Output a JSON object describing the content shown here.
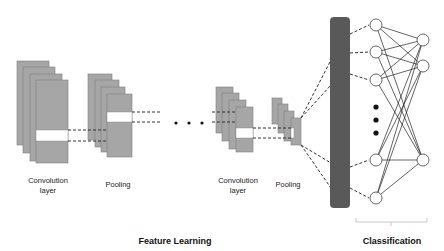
{
  "labels": {
    "conv1": "Convolution layer",
    "pool1": "Pooling",
    "conv2": "Convolution layer",
    "pool2": "Pooling",
    "feature_learning": "Feature Learning",
    "classification": "Classification"
  },
  "colors": {
    "feature_map_fill": "#a6a6a6",
    "feature_map_stroke": "#7f7f7f",
    "highlight_band": "#ffffff",
    "dense_bar": "#595959",
    "node_stroke": "#404040",
    "edge": "#222222",
    "dashed": "#333333"
  },
  "stacks": [
    {
      "name": "conv1-stack",
      "rects": [
        [
          17,
          61,
          32,
          84
        ],
        [
          23,
          67,
          32,
          86
        ],
        [
          30,
          74,
          32,
          87
        ],
        [
          36,
          80,
          32,
          83
        ]
      ],
      "band": [
        36,
        130,
        32,
        11
      ]
    },
    {
      "name": "pool1-stack",
      "rects": [
        [
          88,
          74,
          24,
          66
        ],
        [
          95,
          80,
          24,
          67
        ],
        [
          101,
          87,
          24,
          65
        ],
        [
          107,
          94,
          25,
          63
        ]
      ],
      "band": [
        107,
        112,
        25,
        10
      ]
    },
    {
      "name": "conv2-stack",
      "rects": [
        [
          216,
          87,
          17,
          46
        ],
        [
          222,
          93,
          17,
          48
        ],
        [
          229,
          100,
          17,
          49
        ],
        [
          236,
          107,
          17,
          45
        ]
      ],
      "band": [
        236,
        128,
        17,
        10
      ]
    },
    {
      "name": "pool2-stack",
      "rects": [
        [
          272,
          98,
          10,
          26
        ],
        [
          278,
          104,
          10,
          29
        ],
        [
          284,
          111,
          10,
          30
        ],
        [
          291,
          118,
          10,
          27
        ]
      ],
      "band": [
        291,
        128,
        3,
        10
      ]
    }
  ],
  "dense_bar": {
    "x": 330,
    "y": 17,
    "w": 20,
    "h": 191
  },
  "hidden_nodes": [
    [
      376,
      25
    ],
    [
      376,
      52
    ],
    [
      376,
      80
    ],
    [
      376,
      160
    ],
    [
      376,
      198
    ]
  ],
  "output_nodes": [
    [
      423,
      40
    ],
    [
      423,
      66
    ],
    [
      423,
      160
    ]
  ],
  "ellipsis_dots_h": [
    [
      176,
      123
    ],
    [
      189,
      123
    ],
    [
      202,
      123
    ]
  ],
  "ellipsis_dots_v": [
    [
      376,
      107
    ],
    [
      376,
      120
    ],
    [
      376,
      133
    ]
  ]
}
